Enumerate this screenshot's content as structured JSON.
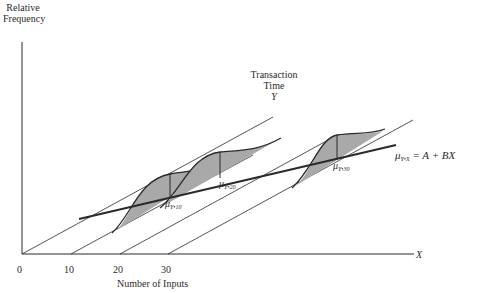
{
  "y_axis": {
    "label_line1": "Relative",
    "label_line2": "Frequency"
  },
  "x_axis": {
    "symbol": "X",
    "label": "Number of Inputs",
    "ticks": [
      "0",
      "10",
      "20",
      "30"
    ]
  },
  "depth_axis": {
    "label_line1": "Transaction",
    "label_line2": "Time",
    "symbol": "Y"
  },
  "regression": {
    "label_prefix": "μ",
    "label_sub": "Y•X",
    "equation": " = A + BX"
  },
  "distributions": [
    {
      "prefix": "μ",
      "sub": "Y•10"
    },
    {
      "prefix": "μ",
      "sub": "Y•20"
    },
    {
      "prefix": "μ",
      "sub": "Y•30"
    }
  ],
  "colors": {
    "ink": "#2a2a2a",
    "shade": "#a9a9a9",
    "background": "#ffffff"
  }
}
